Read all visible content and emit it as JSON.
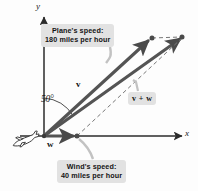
{
  "figure": {
    "background_color": "#fdfdfd",
    "axes": {
      "x_label": "x",
      "y_label": "y",
      "axis_color": "#2b2b2b",
      "origin_px": [
        44,
        136
      ]
    },
    "angle": {
      "label": "50°",
      "value": 50,
      "unit": "degrees",
      "measured_from": "positive y-axis"
    },
    "vectors": [
      {
        "name": "v",
        "label": "v",
        "description": "plane's velocity",
        "magnitude": 180,
        "unit": "miles per hour",
        "color": "#4a4a4a",
        "start_px": [
          44,
          136
        ],
        "end_px": [
          151,
          39
        ]
      },
      {
        "name": "w",
        "label": "w",
        "description": "wind's velocity",
        "magnitude": 40,
        "unit": "miles per hour",
        "color": "#4a4a4a",
        "start_px": [
          44,
          136
        ],
        "end_px": [
          76,
          136
        ]
      },
      {
        "name": "v+w",
        "label": "v + w",
        "description": "resultant velocity of plane relative to ground",
        "color": "#4a4a4a",
        "start_px": [
          44,
          136
        ],
        "end_px": [
          183,
          37
        ]
      }
    ],
    "callouts": [
      {
        "id": "plane-speed",
        "line1": "Plane's speed:",
        "line2": "180 miles per hour",
        "background": "#e2e2e2"
      },
      {
        "id": "wind-speed",
        "line1": "Wind's speed:",
        "line2": "40 miles per hour",
        "background": "#e2e2e2"
      }
    ],
    "icons": {
      "airplane": "airplane-icon"
    }
  }
}
